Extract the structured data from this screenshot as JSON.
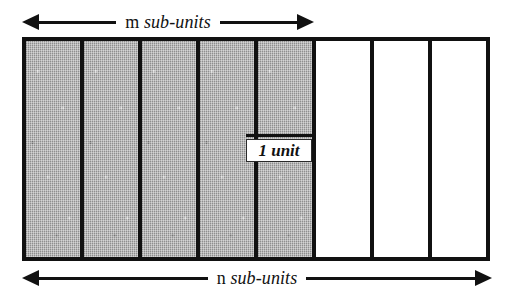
{
  "figure": {
    "name": "unit-subunit-bar-diagram",
    "background_color": "#ffffff",
    "ink_color": "#111111",
    "shaded_color": "#a9a9a9"
  },
  "top_dimension": {
    "variable": "m",
    "units_label": "sub-units",
    "arrow_style": "double-headed",
    "spans_cells": 5
  },
  "bottom_dimension": {
    "variable": "n",
    "units_label": "sub-units",
    "arrow_style": "double-headed",
    "spans_cells": 8
  },
  "unit_callout": {
    "label": "1 unit",
    "points_to_cell_index": 4
  },
  "bar": {
    "total_cells": 8,
    "cells": [
      {
        "index": 0,
        "fill": "shaded"
      },
      {
        "index": 1,
        "fill": "shaded"
      },
      {
        "index": 2,
        "fill": "shaded"
      },
      {
        "index": 3,
        "fill": "shaded"
      },
      {
        "index": 4,
        "fill": "shaded"
      },
      {
        "index": 5,
        "fill": "plain"
      },
      {
        "index": 6,
        "fill": "plain"
      },
      {
        "index": 7,
        "fill": "plain"
      }
    ]
  }
}
